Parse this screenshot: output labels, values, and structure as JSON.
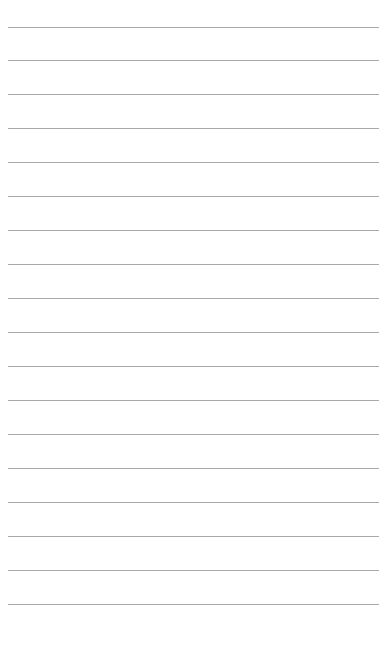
{
  "page": {
    "type": "lined-paper",
    "background_color": "#ffffff",
    "line_color": "#a9a9a9",
    "line_count": 18,
    "line_positions_y": [
      27,
      60,
      94,
      128,
      162,
      196,
      230,
      264,
      298,
      332,
      366,
      400,
      434,
      468,
      502,
      536,
      570,
      604
    ],
    "line_left_x": 8,
    "line_right_x": 379
  }
}
